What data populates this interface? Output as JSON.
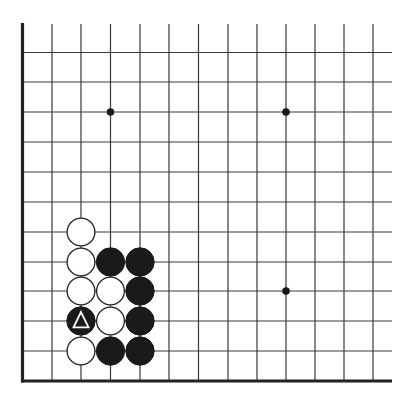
{
  "diagram": {
    "type": "go-board-fragment",
    "corner": "bottom-left",
    "colors": {
      "background": "#ffffff",
      "line": "#3a3a3a",
      "edge": "#222222",
      "black_stone": "#1a1a1a",
      "white_stone": "#ffffff",
      "marker_on_black": "#ffffff"
    },
    "grid": {
      "columns_x": [
        22.5,
        52,
        81,
        110.5,
        140,
        169,
        198.5,
        228,
        257,
        286,
        315,
        344,
        373
      ],
      "rows_y": [
        52.5,
        82,
        112,
        142,
        172,
        202,
        232,
        262,
        291,
        321,
        351,
        381
      ],
      "top_open_y": 24,
      "right_open_x": 392,
      "left_edge_x": 22.5,
      "bottom_edge_y": 381
    },
    "star_points": [
      {
        "col": 3,
        "row": 2
      },
      {
        "col": 9,
        "row": 2
      },
      {
        "col": 9,
        "row": 8
      }
    ],
    "stones": [
      {
        "color": "white",
        "col": 2,
        "row": 6
      },
      {
        "color": "white",
        "col": 2,
        "row": 7
      },
      {
        "color": "black",
        "col": 3,
        "row": 7
      },
      {
        "color": "black",
        "col": 4,
        "row": 7
      },
      {
        "color": "white",
        "col": 2,
        "row": 8
      },
      {
        "color": "white",
        "col": 3,
        "row": 8
      },
      {
        "color": "black",
        "col": 4,
        "row": 8
      },
      {
        "color": "black",
        "col": 2,
        "row": 9,
        "marker": "triangle"
      },
      {
        "color": "white",
        "col": 3,
        "row": 9
      },
      {
        "color": "black",
        "col": 4,
        "row": 9
      },
      {
        "color": "white",
        "col": 2,
        "row": 10
      },
      {
        "color": "black",
        "col": 3,
        "row": 10
      },
      {
        "color": "black",
        "col": 4,
        "row": 10
      }
    ]
  }
}
